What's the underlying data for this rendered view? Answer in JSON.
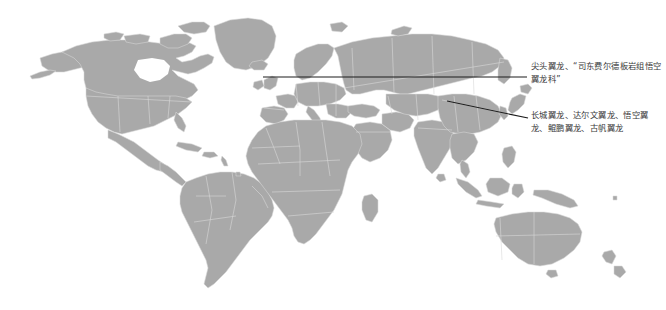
{
  "figure": {
    "type": "annotated-world-map",
    "background_color": "#ffffff",
    "land_color": "#a9a9a9",
    "border_color": "#d8d8d8",
    "leader_line_color": "#1c1c1c",
    "text_color": "#3a3a3a"
  },
  "annotations": [
    {
      "id": "annotation-europe",
      "text": "尖头翼龙、“司东费尔德板岩组悟空翼龙科”",
      "leader_line": {
        "from_x": 263,
        "from_y": 77,
        "to_x": 527,
        "to_y": 77,
        "target_region": "Europe"
      }
    },
    {
      "id": "annotation-east-asia",
      "text": "长城翼龙、达尔文翼龙、悟空翼龙、鲲鹏翼龙、古帆翼龙",
      "leader_line": {
        "from_x": 447,
        "from_y": 101,
        "to_x": 528,
        "to_y": 118,
        "target_region": "East Asia"
      }
    }
  ]
}
